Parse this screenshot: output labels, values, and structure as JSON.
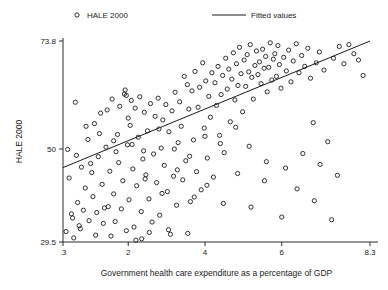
{
  "chart_data": {
    "type": "scatter",
    "title": "",
    "xlabel": "Government health care expenditure as a percentage of GDP",
    "ylabel": "HALE 2000",
    "xlim": [
      0.3,
      8.3
    ],
    "ylim": [
      29.5,
      73.8
    ],
    "grid": false,
    "legend_position": "top",
    "xticks": [
      {
        "value": 0.3,
        "label": ".3"
      },
      {
        "value": 2,
        "label": "2"
      },
      {
        "value": 4,
        "label": "4"
      },
      {
        "value": 6,
        "label": "6"
      },
      {
        "value": 8.3,
        "label": "8.3"
      }
    ],
    "yticks": [
      {
        "value": 73.8,
        "label": "73.8"
      },
      {
        "value": 50,
        "label": "50"
      },
      {
        "value": 29.5,
        "label": "29.5"
      }
    ],
    "legend": [
      {
        "name": "HALE 2000",
        "marker": "circle-open"
      },
      {
        "name": "Fitted values",
        "marker": "line"
      }
    ],
    "series": [
      {
        "name": "HALE 2000",
        "marker": "circle-open",
        "color": "#1a1a1a",
        "points": [
          [
            0.42,
            49.9
          ],
          [
            0.46,
            43.6
          ],
          [
            0.52,
            35.7
          ],
          [
            0.55,
            34.8
          ],
          [
            0.62,
            60.3
          ],
          [
            0.68,
            38.2
          ],
          [
            0.72,
            33.1
          ],
          [
            0.78,
            46.0
          ],
          [
            0.83,
            36.5
          ],
          [
            0.88,
            41.4
          ],
          [
            0.95,
            52.1
          ],
          [
            0.98,
            34.2
          ],
          [
            1.05,
            44.8
          ],
          [
            1.08,
            39.5
          ],
          [
            1.12,
            55.6
          ],
          [
            1.18,
            36.0
          ],
          [
            1.22,
            48.3
          ],
          [
            1.28,
            57.9
          ],
          [
            1.32,
            42.2
          ],
          [
            1.35,
            33.6
          ],
          [
            1.42,
            50.4
          ],
          [
            1.45,
            58.6
          ],
          [
            1.48,
            37.3
          ],
          [
            1.52,
            45.1
          ],
          [
            1.58,
            61.0
          ],
          [
            1.62,
            40.1
          ],
          [
            1.66,
            34.0
          ],
          [
            1.72,
            53.2
          ],
          [
            1.75,
            47.0
          ],
          [
            1.78,
            59.4
          ],
          [
            1.82,
            36.8
          ],
          [
            1.86,
            43.0
          ],
          [
            1.9,
            62.1
          ],
          [
            1.92,
            63.0
          ],
          [
            1.95,
            61.8
          ],
          [
            1.98,
            50.9
          ],
          [
            2.02,
            38.8
          ],
          [
            2.05,
            55.2
          ],
          [
            2.08,
            60.7
          ],
          [
            2.12,
            45.6
          ],
          [
            2.15,
            32.8
          ],
          [
            2.18,
            59.0
          ],
          [
            2.22,
            41.9
          ],
          [
            2.26,
            52.6
          ],
          [
            2.3,
            61.5
          ],
          [
            2.34,
            36.2
          ],
          [
            2.38,
            47.8
          ],
          [
            2.42,
            58.1
          ],
          [
            2.46,
            44.3
          ],
          [
            2.5,
            54.0
          ],
          [
            2.54,
            39.0
          ],
          [
            2.58,
            60.0
          ],
          [
            2.62,
            33.9
          ],
          [
            2.66,
            48.9
          ],
          [
            2.7,
            57.2
          ],
          [
            2.74,
            42.6
          ],
          [
            2.78,
            61.2
          ],
          [
            2.82,
            35.4
          ],
          [
            2.86,
            50.2
          ],
          [
            2.9,
            56.4
          ],
          [
            2.94,
            46.4
          ],
          [
            2.98,
            59.8
          ],
          [
            3.02,
            40.6
          ],
          [
            3.06,
            53.8
          ],
          [
            3.1,
            31.2
          ],
          [
            3.14,
            58.4
          ],
          [
            3.18,
            44.0
          ],
          [
            3.22,
            62.5
          ],
          [
            3.26,
            37.6
          ],
          [
            3.3,
            51.4
          ],
          [
            3.34,
            60.4
          ],
          [
            3.38,
            55.0
          ],
          [
            3.42,
            43.2
          ],
          [
            3.46,
            66.0
          ],
          [
            3.5,
            47.4
          ],
          [
            3.54,
            64.2
          ],
          [
            3.58,
            58.8
          ],
          [
            3.62,
            38.4
          ],
          [
            3.66,
            62.8
          ],
          [
            3.7,
            52.0
          ],
          [
            3.74,
            67.1
          ],
          [
            3.78,
            45.0
          ],
          [
            3.82,
            59.2
          ],
          [
            3.86,
            63.6
          ],
          [
            3.9,
            41.0
          ],
          [
            3.94,
            69.0
          ],
          [
            3.98,
            54.6
          ],
          [
            4.02,
            65.0
          ],
          [
            4.06,
            48.0
          ],
          [
            4.1,
            61.6
          ],
          [
            4.14,
            57.0
          ],
          [
            4.18,
            66.8
          ],
          [
            4.22,
            43.8
          ],
          [
            4.26,
            64.6
          ],
          [
            4.3,
            59.6
          ],
          [
            4.34,
            68.2
          ],
          [
            4.38,
            53.0
          ],
          [
            4.42,
            62.0
          ],
          [
            4.46,
            66.2
          ],
          [
            4.5,
            49.2
          ],
          [
            4.54,
            70.0
          ],
          [
            4.58,
            63.2
          ],
          [
            4.62,
            67.6
          ],
          [
            4.66,
            56.0
          ],
          [
            4.7,
            65.4
          ],
          [
            4.74,
            71.2
          ],
          [
            4.78,
            60.8
          ],
          [
            4.82,
            68.8
          ],
          [
            4.86,
            64.0
          ],
          [
            4.9,
            72.4
          ],
          [
            4.94,
            66.6
          ],
          [
            4.98,
            58.2
          ],
          [
            5.02,
            69.6
          ],
          [
            5.06,
            63.8
          ],
          [
            5.1,
            70.8
          ],
          [
            5.14,
            67.0
          ],
          [
            5.18,
            73.0
          ],
          [
            5.22,
            65.8
          ],
          [
            5.26,
            61.0
          ],
          [
            5.3,
            68.4
          ],
          [
            5.34,
            71.6
          ],
          [
            5.38,
            66.4
          ],
          [
            5.42,
            69.2
          ],
          [
            5.46,
            64.4
          ],
          [
            5.5,
            72.0
          ],
          [
            5.54,
            67.8
          ],
          [
            5.58,
            70.4
          ],
          [
            5.62,
            62.6
          ],
          [
            5.66,
            68.0
          ],
          [
            5.7,
            73.4
          ],
          [
            5.74,
            65.2
          ],
          [
            5.78,
            69.8
          ],
          [
            5.82,
            71.0
          ],
          [
            5.86,
            66.0
          ],
          [
            5.9,
            72.8
          ],
          [
            5.94,
            68.6
          ],
          [
            5.98,
            63.4
          ],
          [
            6.05,
            70.2
          ],
          [
            6.12,
            67.2
          ],
          [
            6.18,
            71.8
          ],
          [
            6.24,
            64.8
          ],
          [
            6.3,
            69.4
          ],
          [
            6.38,
            73.2
          ],
          [
            6.45,
            66.8
          ],
          [
            6.52,
            70.6
          ],
          [
            6.6,
            68.2
          ],
          [
            6.68,
            72.2
          ],
          [
            6.75,
            65.6
          ],
          [
            6.82,
            55.8
          ],
          [
            6.9,
            69.0
          ],
          [
            6.98,
            71.4
          ],
          [
            7.1,
            67.4
          ],
          [
            7.2,
            51.6
          ],
          [
            7.35,
            70.0
          ],
          [
            7.5,
            72.6
          ],
          [
            7.62,
            68.8
          ],
          [
            7.75,
            73.0
          ],
          [
            7.88,
            71.0
          ],
          [
            8.0,
            69.6
          ],
          [
            8.12,
            66.2
          ],
          [
            0.38,
            31.8
          ],
          [
            0.58,
            30.4
          ],
          [
            0.75,
            32.4
          ],
          [
            1.15,
            31.0
          ],
          [
            1.55,
            30.8
          ],
          [
            1.95,
            32.0
          ],
          [
            2.35,
            30.2
          ],
          [
            2.55,
            31.6
          ],
          [
            3.05,
            32.2
          ],
          [
            3.55,
            31.4
          ],
          [
            2.2,
            29.9
          ],
          [
            1.38,
            37.0
          ],
          [
            0.65,
            48.6
          ],
          [
            1.02,
            46.8
          ],
          [
            1.68,
            49.4
          ],
          [
            2.1,
            51.0
          ],
          [
            2.44,
            43.4
          ],
          [
            2.88,
            40.2
          ],
          [
            3.28,
            45.4
          ],
          [
            3.72,
            39.4
          ],
          [
            4.05,
            42.0
          ],
          [
            4.48,
            38.0
          ],
          [
            4.85,
            44.6
          ],
          [
            5.2,
            37.2
          ],
          [
            5.55,
            43.0
          ],
          [
            6.0,
            35.0
          ],
          [
            6.4,
            41.2
          ],
          [
            6.85,
            38.6
          ],
          [
            7.3,
            34.4
          ],
          [
            0.9,
            55.0
          ],
          [
            1.25,
            53.4
          ],
          [
            1.62,
            51.8
          ],
          [
            2.0,
            56.8
          ],
          [
            2.4,
            49.6
          ],
          [
            2.8,
            54.4
          ],
          [
            3.2,
            50.0
          ],
          [
            3.6,
            48.4
          ],
          [
            4.0,
            52.8
          ],
          [
            4.4,
            51.2
          ],
          [
            4.8,
            54.8
          ],
          [
            5.15,
            50.6
          ],
          [
            5.6,
            47.2
          ],
          [
            6.1,
            45.8
          ],
          [
            6.55,
            49.0
          ],
          [
            7.0,
            46.6
          ],
          [
            7.45,
            44.2
          ]
        ]
      }
    ],
    "fit_line": {
      "name": "Fitted values",
      "color": "#1a1a1a",
      "x_start": 0.3,
      "y_start": 45.9,
      "x_end": 8.3,
      "y_end": 73.8
    }
  }
}
